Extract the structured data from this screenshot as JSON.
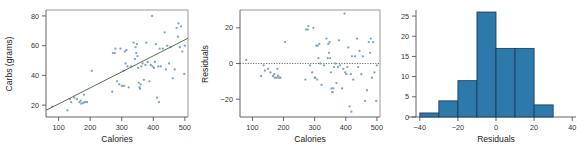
{
  "figure": {
    "background": "#ffffff",
    "panel_count": 3
  },
  "colors": {
    "point": "#7ea3c4",
    "regression_line": "#5f6b4f",
    "bar_fill": "#2e79ab",
    "bar_stroke": "#17384f",
    "axis": "#555555",
    "frame": "#8c8c8c",
    "text": "#222222"
  },
  "chart_data": [
    {
      "type": "scatter",
      "panel": "left",
      "title": "",
      "xlabel": "Calories",
      "ylabel": "Carbs (grams)",
      "xlim": [
        60,
        510
      ],
      "ylim": [
        12,
        84
      ],
      "xticks": [
        100,
        200,
        300,
        400,
        500
      ],
      "yticks": [
        20,
        40,
        60,
        80
      ],
      "grid": false,
      "legend": "none",
      "trendline": {
        "type": "linear",
        "x_start": 60,
        "y_start": 16.5,
        "x_end": 510,
        "y_end": 65.0
      },
      "points": [
        [
          80,
          19
        ],
        [
          128,
          16.5
        ],
        [
          136,
          24
        ],
        [
          140,
          22
        ],
        [
          150,
          25
        ],
        [
          158,
          24
        ],
        [
          166,
          22
        ],
        [
          170,
          23
        ],
        [
          172,
          21
        ],
        [
          178,
          21.5
        ],
        [
          180,
          27
        ],
        [
          182,
          22
        ],
        [
          186,
          22
        ],
        [
          190,
          22
        ],
        [
          205,
          43
        ],
        [
          270,
          29
        ],
        [
          272,
          55
        ],
        [
          278,
          55
        ],
        [
          280,
          58
        ],
        [
          285,
          36
        ],
        [
          292,
          34
        ],
        [
          296,
          58
        ],
        [
          300,
          33
        ],
        [
          302,
          33
        ],
        [
          305,
          43
        ],
        [
          308,
          33
        ],
        [
          310,
          56
        ],
        [
          312,
          48
        ],
        [
          315,
          57
        ],
        [
          318,
          46
        ],
        [
          322,
          32
        ],
        [
          330,
          46
        ],
        [
          338,
          62
        ],
        [
          342,
          51
        ],
        [
          344,
          59
        ],
        [
          346,
          55
        ],
        [
          348,
          61
        ],
        [
          350,
          53
        ],
        [
          352,
          45
        ],
        [
          354,
          35
        ],
        [
          356,
          32
        ],
        [
          358,
          31
        ],
        [
          360,
          34
        ],
        [
          362,
          46
        ],
        [
          366,
          48
        ],
        [
          370,
          37
        ],
        [
          375,
          47
        ],
        [
          378,
          62
        ],
        [
          382,
          49
        ],
        [
          388,
          36
        ],
        [
          392,
          47
        ],
        [
          396,
          80
        ],
        [
          398,
          46
        ],
        [
          402,
          45
        ],
        [
          405,
          49
        ],
        [
          408,
          61
        ],
        [
          412,
          25
        ],
        [
          416,
          46
        ],
        [
          418,
          22
        ],
        [
          420,
          58
        ],
        [
          424,
          46
        ],
        [
          430,
          58
        ],
        [
          436,
          69
        ],
        [
          440,
          44
        ],
        [
          444,
          60
        ],
        [
          450,
          48
        ],
        [
          455,
          59
        ],
        [
          462,
          38
        ],
        [
          468,
          44
        ],
        [
          474,
          72
        ],
        [
          478,
          66
        ],
        [
          480,
          75
        ],
        [
          484,
          59
        ],
        [
          488,
          73
        ],
        [
          492,
          56
        ],
        [
          498,
          41
        ],
        [
          500,
          60
        ]
      ]
    },
    {
      "type": "scatter",
      "panel": "middle",
      "title": "",
      "xlabel": "Calories",
      "ylabel": "Residuals",
      "xlim": [
        60,
        510
      ],
      "ylim": [
        -30,
        30
      ],
      "xticks": [
        100,
        200,
        300,
        400,
        500
      ],
      "yticks": [
        -20,
        0,
        20
      ],
      "grid": false,
      "legend": "none",
      "reference_line": {
        "type": "horizontal",
        "y": 0,
        "style": "dotted"
      },
      "points": [
        [
          80,
          2
        ],
        [
          128,
          -7
        ],
        [
          136,
          -1
        ],
        [
          140,
          -4
        ],
        [
          150,
          -3
        ],
        [
          158,
          -5
        ],
        [
          166,
          -7
        ],
        [
          170,
          -6
        ],
        [
          172,
          -8
        ],
        [
          178,
          -8
        ],
        [
          180,
          -3
        ],
        [
          182,
          -7
        ],
        [
          186,
          -8
        ],
        [
          190,
          -8
        ],
        [
          205,
          12
        ],
        [
          270,
          -9
        ],
        [
          272,
          19
        ],
        [
          278,
          19
        ],
        [
          280,
          21
        ],
        [
          285,
          -1
        ],
        [
          292,
          -5
        ],
        [
          296,
          20
        ],
        [
          300,
          -8
        ],
        [
          302,
          -8
        ],
        [
          305,
          10
        ],
        [
          308,
          -9
        ],
        [
          310,
          10
        ],
        [
          312,
          3
        ],
        [
          315,
          11
        ],
        [
          318,
          0
        ],
        [
          322,
          -12
        ],
        [
          330,
          -1
        ],
        [
          338,
          14
        ],
        [
          342,
          3
        ],
        [
          344,
          11
        ],
        [
          346,
          6
        ],
        [
          348,
          12
        ],
        [
          350,
          3
        ],
        [
          352,
          -5
        ],
        [
          354,
          -14
        ],
        [
          356,
          -16
        ],
        [
          358,
          -16
        ],
        [
          360,
          -14
        ],
        [
          362,
          -2
        ],
        [
          366,
          0
        ],
        [
          370,
          -11
        ],
        [
          375,
          -2
        ],
        [
          378,
          13
        ],
        [
          382,
          -1
        ],
        [
          388,
          -14
        ],
        [
          392,
          -3
        ],
        [
          396,
          28
        ],
        [
          398,
          -5
        ],
        [
          402,
          -6
        ],
        [
          405,
          -2
        ],
        [
          408,
          9
        ],
        [
          412,
          -24
        ],
        [
          416,
          -6
        ],
        [
          418,
          -27
        ],
        [
          420,
          4
        ],
        [
          424,
          -9
        ],
        [
          430,
          4
        ],
        [
          436,
          14
        ],
        [
          440,
          -2
        ],
        [
          444,
          7
        ],
        [
          450,
          -6
        ],
        [
          455,
          4
        ],
        [
          462,
          -21
        ],
        [
          468,
          -15
        ],
        [
          474,
          12
        ],
        [
          478,
          6
        ],
        [
          480,
          14
        ],
        [
          484,
          -8
        ],
        [
          488,
          12
        ],
        [
          492,
          -5
        ],
        [
          498,
          -21
        ],
        [
          500,
          -1
        ]
      ]
    },
    {
      "type": "bar",
      "panel": "right",
      "subtype": "histogram",
      "title": "",
      "xlabel": "Residuals",
      "ylabel": "",
      "xlim": [
        -42,
        42
      ],
      "ylim": [
        0,
        26.5
      ],
      "xticks": [
        -40,
        -20,
        0,
        20,
        40
      ],
      "yticks": [
        0,
        5,
        10,
        15,
        20,
        25
      ],
      "grid": false,
      "legend": "none",
      "bin_width": 10,
      "bin_edges": [
        -40,
        -30,
        -20,
        -10,
        0,
        10,
        20,
        30
      ],
      "categories": [
        "-40 to -30",
        "-30 to -20",
        "-20 to -10",
        "-10 to 0",
        "0 to 10",
        "10 to 20",
        "20 to 30"
      ],
      "values": [
        1,
        4,
        9,
        26,
        17,
        17,
        3
      ]
    }
  ]
}
